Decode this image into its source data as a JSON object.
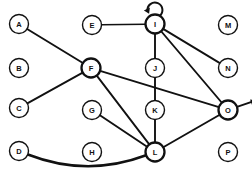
{
  "diagram": {
    "type": "node-link-graph",
    "width": 252,
    "height": 174,
    "background_color": "#ffffff",
    "line_color": "#111111",
    "node_fill": "#ffffff",
    "node_radius": 9.5,
    "nodes": [
      {
        "id": "A",
        "label": "A",
        "x": 19,
        "y": 24,
        "emphasis": "normal"
      },
      {
        "id": "B",
        "label": "B",
        "x": 19,
        "y": 68,
        "emphasis": "normal"
      },
      {
        "id": "C",
        "label": "C",
        "x": 19,
        "y": 108,
        "emphasis": "normal"
      },
      {
        "id": "D",
        "label": "D",
        "x": 19,
        "y": 151,
        "emphasis": "normal"
      },
      {
        "id": "E",
        "label": "E",
        "x": 92,
        "y": 25,
        "emphasis": "normal"
      },
      {
        "id": "F",
        "label": "F",
        "x": 91,
        "y": 68,
        "emphasis": "bold"
      },
      {
        "id": "G",
        "label": "G",
        "x": 92,
        "y": 110,
        "emphasis": "normal"
      },
      {
        "id": "H",
        "label": "H",
        "x": 92,
        "y": 152,
        "emphasis": "normal"
      },
      {
        "id": "I",
        "label": "I",
        "x": 155,
        "y": 24,
        "emphasis": "bold"
      },
      {
        "id": "J",
        "label": "J",
        "x": 155,
        "y": 68,
        "emphasis": "normal"
      },
      {
        "id": "K",
        "label": "K",
        "x": 155,
        "y": 110,
        "emphasis": "normal"
      },
      {
        "id": "L",
        "label": "L",
        "x": 155,
        "y": 152,
        "emphasis": "bold"
      },
      {
        "id": "M",
        "label": "M",
        "x": 228,
        "y": 25,
        "emphasis": "normal"
      },
      {
        "id": "N",
        "label": "N",
        "x": 228,
        "y": 68,
        "emphasis": "normal"
      },
      {
        "id": "O",
        "label": "O",
        "x": 228,
        "y": 110,
        "emphasis": "bold"
      },
      {
        "id": "P",
        "label": "P",
        "x": 228,
        "y": 152,
        "emphasis": "normal"
      }
    ],
    "edges": [
      {
        "from": "A",
        "to": "F",
        "style": "straight",
        "weight": 1.9
      },
      {
        "from": "C",
        "to": "F",
        "style": "straight",
        "weight": 1.9
      },
      {
        "from": "E",
        "to": "I",
        "style": "straight",
        "weight": 1.5
      },
      {
        "from": "F",
        "to": "O",
        "style": "straight",
        "weight": 1.9
      },
      {
        "from": "F",
        "to": "L",
        "style": "straight",
        "weight": 1.9
      },
      {
        "from": "G",
        "to": "L",
        "style": "straight",
        "weight": 1.9
      },
      {
        "from": "I",
        "to": "N",
        "style": "straight",
        "weight": 1.9
      },
      {
        "from": "I",
        "to": "O",
        "style": "straight",
        "weight": 1.9
      },
      {
        "from": "I",
        "to": "L",
        "style": "straight",
        "weight": 1.9
      },
      {
        "from": "L",
        "to": "O",
        "style": "straight",
        "weight": 1.9
      },
      {
        "from": "D",
        "to": "L",
        "style": "curve",
        "weight": 2.6,
        "curve_sag": 26
      }
    ],
    "self_loops": [
      {
        "node": "I",
        "position": "top",
        "arrow_direction": "left",
        "radius": 7.5
      }
    ],
    "out_arrows": [
      {
        "node": "O",
        "direction": "right-up",
        "length": 17
      }
    ],
    "isolated_nodes": [
      "B",
      "H",
      "J",
      "K",
      "M",
      "P"
    ]
  }
}
